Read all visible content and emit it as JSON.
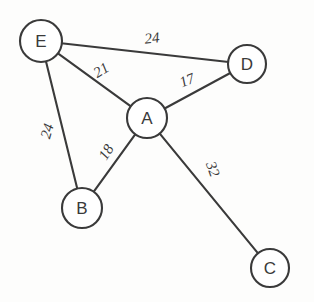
{
  "diagram": {
    "type": "weighted-undirected-graph",
    "title": "",
    "canvas": {
      "width": 314,
      "height": 302,
      "background": "#fdfdfc"
    },
    "style": {
      "stroke_color": "#3a3a3a",
      "node_fill": "#ffffff",
      "stroke_width": 2.1
    },
    "nodes": [
      {
        "id": "E",
        "label": "E",
        "x": 41,
        "y": 41,
        "r": 21
      },
      {
        "id": "D",
        "label": "D",
        "x": 247,
        "y": 64,
        "r": 19
      },
      {
        "id": "A",
        "label": "A",
        "x": 147,
        "y": 118,
        "r": 20
      },
      {
        "id": "B",
        "label": "B",
        "x": 82,
        "y": 208,
        "r": 20
      },
      {
        "id": "C",
        "label": "C",
        "x": 270,
        "y": 268,
        "r": 19
      }
    ],
    "edges": [
      {
        "from": "E",
        "to": "D",
        "weight": "24",
        "label_x": 152,
        "label_y": 38,
        "label_rotate": -6
      },
      {
        "from": "E",
        "to": "A",
        "weight": "21",
        "label_x": 101,
        "label_y": 70,
        "label_rotate": -32
      },
      {
        "from": "E",
        "to": "B",
        "weight": "24",
        "label_x": 47,
        "label_y": 131,
        "label_rotate": -74
      },
      {
        "from": "A",
        "to": "D",
        "weight": "17",
        "label_x": 187,
        "label_y": 80,
        "label_rotate": -22
      },
      {
        "from": "A",
        "to": "B",
        "weight": "18",
        "label_x": 106,
        "label_y": 152,
        "label_rotate": -58
      },
      {
        "from": "A",
        "to": "C",
        "weight": "32",
        "label_x": 213,
        "label_y": 169,
        "label_rotate": 70
      }
    ]
  }
}
